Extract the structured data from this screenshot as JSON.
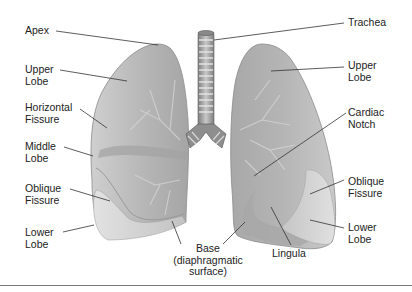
{
  "figure": {
    "colors": {
      "lung_base": "#b9b9b9",
      "lung_light": "#dcdcdc",
      "lung_dark": "#8f8f8f",
      "trachea": "#9a9a9a",
      "leader_line": "#333333",
      "text": "#222222",
      "rule": "#777777"
    }
  },
  "labels": {
    "left": [
      {
        "id": "apex",
        "text": "Apex"
      },
      {
        "id": "upper_lobe_left",
        "text": "Upper\nLobe"
      },
      {
        "id": "horizontal_fissure",
        "text": "Horizontal\nFissure"
      },
      {
        "id": "middle_lobe",
        "text": "Middle\nLobe"
      },
      {
        "id": "oblique_fissure_left",
        "text": "Oblique\nFissure"
      },
      {
        "id": "lower_lobe_left",
        "text": "Lower\nLobe"
      }
    ],
    "right": [
      {
        "id": "trachea",
        "text": "Trachea"
      },
      {
        "id": "upper_lobe_right",
        "text": "Upper\nLobe"
      },
      {
        "id": "cardiac_notch",
        "text": "Cardiac\nNotch"
      },
      {
        "id": "oblique_fissure_right",
        "text": "Oblique\nFissure"
      },
      {
        "id": "lower_lobe_right",
        "text": "Lower\nLobe"
      }
    ],
    "bottom": [
      {
        "id": "base",
        "text": "Base\n(diaphragmatic\nsurface)"
      },
      {
        "id": "lingula",
        "text": "Lingula"
      }
    ]
  }
}
